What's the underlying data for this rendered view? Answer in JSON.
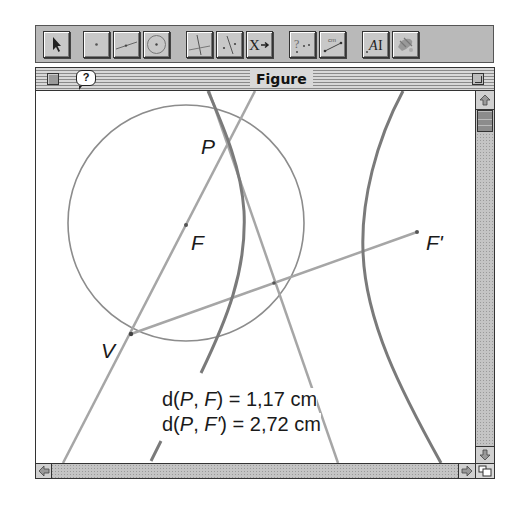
{
  "toolbar": {
    "tools": [
      {
        "name": "pointer-tool",
        "icon": "arrow-pointer-icon"
      },
      {
        "name": "point-tool",
        "icon": "point-icon"
      },
      {
        "name": "line-tool",
        "icon": "line-icon"
      },
      {
        "name": "circle-tool",
        "icon": "circle-icon"
      },
      {
        "name": "perpendicular-tool",
        "icon": "perpendicular-icon"
      },
      {
        "name": "symmetry-tool",
        "icon": "reflection-icon"
      },
      {
        "name": "transform-tool",
        "icon": "transform-icon",
        "label": "X"
      },
      {
        "name": "property-check-tool",
        "icon": "question-points-icon",
        "label": "?"
      },
      {
        "name": "measure-tool",
        "icon": "measure-icon",
        "label": "cm"
      },
      {
        "name": "text-tool",
        "icon": "text-icon",
        "label": "AI"
      },
      {
        "name": "attributes-tool",
        "icon": "paint-icon"
      }
    ]
  },
  "window": {
    "title": "Figure",
    "help_label": "?"
  },
  "figure": {
    "points": {
      "P": "P",
      "F": "F",
      "F_prime": "F'",
      "V": "V"
    },
    "measurements": [
      {
        "prefix": "d(",
        "a": "P",
        "sep": ", ",
        "b": "F",
        "suffix": ") = ",
        "value": "1,17 cm"
      },
      {
        "prefix": "d(",
        "a": "P",
        "sep": ", ",
        "b": "F'",
        "suffix": ") = ",
        "value": "2,72 cm"
      }
    ],
    "colors": {
      "curve": "#7a7a7a",
      "line": "#a6a6a6",
      "circle": "#8c8c8c",
      "point": "#555555"
    }
  }
}
